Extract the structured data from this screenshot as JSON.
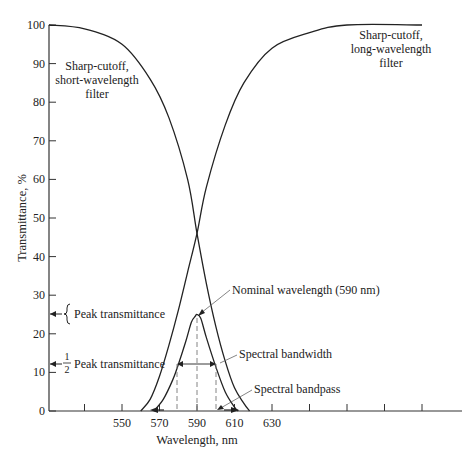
{
  "chart_data": {
    "type": "line",
    "title": "",
    "xlabel": "Wavelength, nm",
    "ylabel": "Transmittance, %",
    "xlim": [
      511,
      730
    ],
    "ylim": [
      0,
      100
    ],
    "x_ticks": [
      530,
      550,
      570,
      590,
      610,
      630,
      650,
      670,
      690,
      710
    ],
    "x_tick_labels": [
      "",
      "550",
      "570",
      "590",
      "610",
      "630",
      "",
      "",
      "",
      ""
    ],
    "y_ticks": [
      0,
      10,
      20,
      30,
      40,
      50,
      60,
      70,
      80,
      90,
      100
    ],
    "y_tick_labels": [
      "0",
      "10",
      "20",
      "30",
      "40",
      "50",
      "60",
      "70",
      "80",
      "90",
      "100"
    ],
    "grid": false,
    "series": [
      {
        "name": "Sharp-cutoff, short-wavelength filter",
        "x": [
          511,
          530,
          550,
          565,
          575,
          585,
          590,
          595,
          600,
          605,
          610,
          615,
          618
        ],
        "values": [
          100,
          99,
          95,
          86,
          76,
          60,
          46,
          33,
          22,
          13,
          6,
          2,
          0
        ]
      },
      {
        "name": "Sharp-cutoff, long-wavelength filter",
        "x": [
          560,
          565,
          570,
          575,
          580,
          585,
          590,
          595,
          605,
          615,
          630,
          650,
          670,
          710
        ],
        "values": [
          0,
          3,
          9,
          17,
          26,
          36,
          46,
          58,
          74,
          85,
          94,
          98,
          100,
          100
        ]
      },
      {
        "name": "Bandpass (combined)",
        "x": [
          567,
          572,
          577,
          580,
          584,
          587,
          589,
          590,
          592,
          595,
          600,
          605,
          610,
          612
        ],
        "values": [
          0,
          3,
          8,
          12,
          18,
          23,
          24.5,
          25,
          24,
          19,
          11.5,
          5,
          1,
          0
        ]
      }
    ],
    "annotations": [
      {
        "text": "Sharp-cutoff,\nshort-wavelength\nfilter",
        "position": "top-left"
      },
      {
        "text": "Sharp-cutoff,\nlong-wavelength\nfilter",
        "position": "top-right"
      },
      {
        "text": "Nominal wavelength (590 nm)",
        "points_to": [
          590,
          25
        ]
      },
      {
        "text": "Peak transmittance",
        "y": 25
      },
      {
        "text": "1/2 Peak transmittance",
        "y": 12.5
      },
      {
        "text": "Spectral bandwidth",
        "span": [
          580,
          600
        ],
        "y": 12.5
      },
      {
        "text": "Spectral bandpass",
        "span": [
          570,
          610
        ],
        "y": 0
      }
    ]
  },
  "labels": {
    "y_title": "Transmittance, %",
    "x_title": "Wavelength, nm",
    "short_filter": [
      "Sharp-cutoff,",
      "short-wavelength",
      "filter"
    ],
    "long_filter": [
      "Sharp-cutoff,",
      "long-wavelength",
      "filter"
    ],
    "nominal": "Nominal wavelength (590 nm)",
    "peak": "Peak transmittance",
    "half_num": "1",
    "half_den": "2",
    "half_peak": "Peak transmittance",
    "bandwidth": "Spectral bandwidth",
    "bandpass": "Spectral bandpass"
  }
}
